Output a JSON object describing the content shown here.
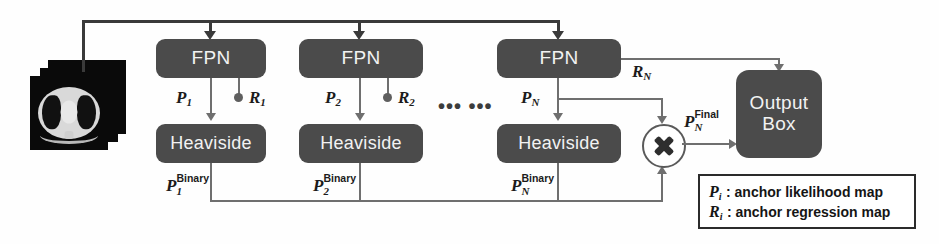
{
  "diagram": {
    "colors": {
      "node_fill": "#4b4b4b",
      "node_text": "#f2f2f2",
      "connector": "#6f6f6f",
      "bus": "#3a3a3a",
      "legend_border": "#2b2b2b",
      "background": "#ffffff"
    },
    "input": {
      "name": "ct-slice-stack",
      "layers": 3
    },
    "columns": [
      {
        "id": "1",
        "fpn_label": "FPN",
        "heaviside_label": "Heaviside",
        "p_base": "P",
        "p_index": "1",
        "r_base": "R",
        "r_index": "1",
        "binary_base": "P",
        "binary_index": "1",
        "binary_sup": "Binary"
      },
      {
        "id": "2",
        "fpn_label": "FPN",
        "heaviside_label": "Heaviside",
        "p_base": "P",
        "p_index": "2",
        "r_base": "R",
        "r_index": "2",
        "binary_base": "P",
        "binary_index": "2",
        "binary_sup": "Binary"
      },
      {
        "id": "N",
        "fpn_label": "FPN",
        "heaviside_label": "Heaviside",
        "p_base": "P",
        "p_index": "N",
        "r_base": "R",
        "r_index": "N",
        "binary_base": "P",
        "binary_index": "N",
        "binary_sup": "Binary"
      }
    ],
    "ellipsis": "•••  •••",
    "multiply": {
      "name": "multiply-node",
      "symbol": "✕"
    },
    "final": {
      "base": "P",
      "index": "N",
      "sup": "Final"
    },
    "output": {
      "line1": "Output",
      "line2": "Box"
    },
    "legend": {
      "rows": [
        {
          "symbol": "P",
          "symbol_sub": "i",
          "text": ": anchor likelihood map"
        },
        {
          "symbol": "R",
          "symbol_sub": "i",
          "text": ": anchor regression map"
        }
      ]
    }
  }
}
